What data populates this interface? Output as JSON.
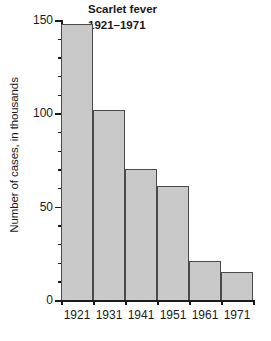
{
  "chart_data": {
    "type": "bar",
    "title": "Scarlet fever",
    "subtitle": "1921–1971",
    "categories": [
      "1921",
      "1931",
      "1941",
      "1951",
      "1961",
      "1971"
    ],
    "values": [
      148,
      102,
      70,
      61,
      21,
      15
    ],
    "xlabel": "",
    "ylabel": "Number of cases, in thousands",
    "ylim": [
      0,
      150
    ],
    "xlim_categories": 6,
    "y_major_ticks": [
      0,
      50,
      100,
      150
    ],
    "y_minor_tick_interval": 10,
    "y_tick_labels": [
      "0",
      "50",
      "100",
      "150"
    ],
    "grid": false,
    "legend": "none",
    "bar_gap": 0,
    "colors": {
      "bar_fill": "#c9c9c9",
      "bar_edge": "#4a4a4a",
      "axis": "#1a1a1a",
      "text": "#1a1a1a",
      "background": "#ffffff"
    }
  }
}
